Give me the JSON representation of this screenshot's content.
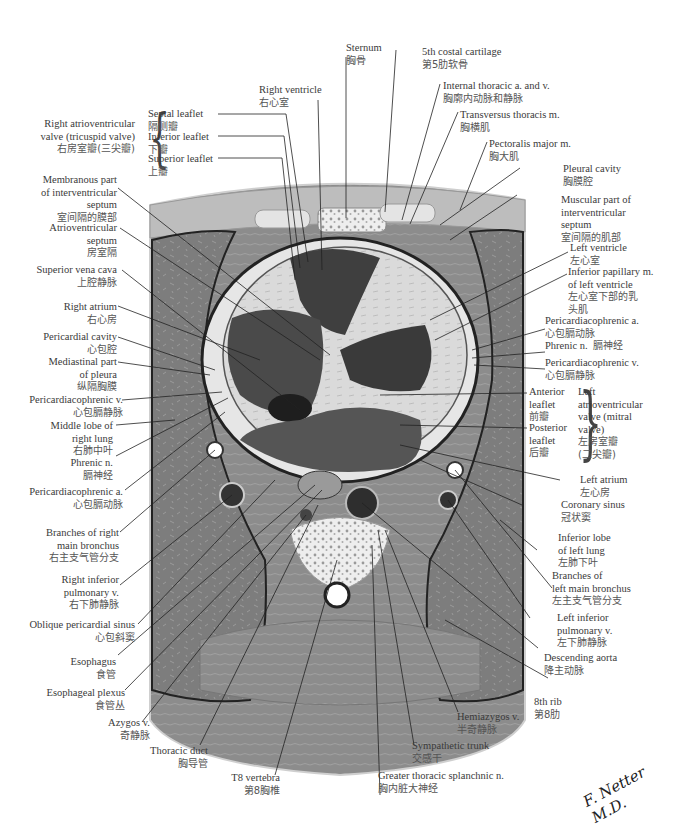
{
  "figure": {
    "type": "anatomical cross-section",
    "palette": {
      "background": "#ffffff",
      "muscle": "#8a8a8a",
      "lung": "#7b7b7b",
      "heart_wall": "#d8d8d8",
      "chamber_dark": "#3c3c3c",
      "bone": "#efefef",
      "line": "#222222",
      "text": "#3a3a3a"
    },
    "signature": "F. Netter M.D."
  },
  "labels": {
    "sternum": {
      "en": "Sternum",
      "zh": "胸骨"
    },
    "costal_cartilage": {
      "en": "5th costal cartilage",
      "zh": "第5肋软骨"
    },
    "internal_thoracic": {
      "en": "Internal thoracic a. and v.",
      "zh": "胸廓内动脉和静脉"
    },
    "transversus_thoracis": {
      "en": "Transversus thoracis m.",
      "zh": "胸横肌"
    },
    "pectoralis_major": {
      "en": "Pectoralis major m.",
      "zh": "胸大肌"
    },
    "right_ventricle": {
      "en": "Right ventricle",
      "zh": "右心室"
    },
    "tricuspid": {
      "group_en": [
        "Right atrioventricular",
        "valve (tricuspid valve)"
      ],
      "group_zh": "右房室瓣(三尖瓣)",
      "leaflets": [
        {
          "en": "Septal leaflet",
          "zh": "隔侧瓣"
        },
        {
          "en": "Inferior leaflet",
          "zh": "下瓣"
        },
        {
          "en": "Superior leaflet",
          "zh": "上瓣"
        }
      ]
    },
    "membranous_septum": {
      "en": [
        "Membranous part",
        "of interventricular",
        "septum"
      ],
      "zh": "室间隔的膜部"
    },
    "av_septum": {
      "en": [
        "Atrioventricular",
        "septum"
      ],
      "zh": "房室隔"
    },
    "svc": {
      "en": "Superior vena cava",
      "zh": "上腔静脉"
    },
    "right_atrium": {
      "en": "Right atrium",
      "zh": "右心房"
    },
    "pericardial_cavity": {
      "en": "Pericardial cavity",
      "zh": "心包腔"
    },
    "mediastinal_pleura": {
      "en": [
        "Mediastinal part",
        "of pleura"
      ],
      "zh": "纵隔胸膜"
    },
    "pericardiacophrenic_v_right": {
      "en": "Pericardiacophrenic v.",
      "zh": "心包膈静脉"
    },
    "middle_lobe": {
      "en": [
        "Middle lobe of",
        "right lung"
      ],
      "zh": "右肺中叶"
    },
    "phrenic_right": {
      "en": "Phrenic n.",
      "zh": "膈神经"
    },
    "pericardiacophrenic_a_right": {
      "en": "Pericardiacophrenic a.",
      "zh": "心包膈动脉"
    },
    "right_bronchus": {
      "en": [
        "Branches of right",
        "main bronchus"
      ],
      "zh": "右主支气管分支"
    },
    "right_inf_pulm_v": {
      "en": [
        "Right inferior",
        "pulmonary v."
      ],
      "zh": "右下肺静脉"
    },
    "oblique_sinus": {
      "en": "Oblique pericardial sinus",
      "zh": "心包斜窦"
    },
    "esophagus": {
      "en": "Esophagus",
      "zh": "食管"
    },
    "esophageal_plexus": {
      "en": "Esophageal plexus",
      "zh": "食管丛"
    },
    "azygos": {
      "en": "Azygos v.",
      "zh": "奇静脉"
    },
    "thoracic_duct": {
      "en": "Thoracic duct",
      "zh": "胸导管"
    },
    "t8": {
      "en": "T8 vertebra",
      "zh": "第8胸椎"
    },
    "greater_splanchnic": {
      "en": "Greater thoracic splanchnic n.",
      "zh": "胸内脏大神经"
    },
    "sympathetic_trunk": {
      "en": "Sympathetic trunk",
      "zh": "交感干"
    },
    "hemiazygos": {
      "en": "Hemiazygos v.",
      "zh": "半奇静脉"
    },
    "rib8": {
      "en": "8th rib",
      "zh": "第8肋"
    },
    "descending_aorta": {
      "en": "Descending aorta",
      "zh": "降主动脉"
    },
    "left_inf_pulm_v": {
      "en": [
        "Left inferior",
        "pulmonary v."
      ],
      "zh": "左下肺静脉"
    },
    "left_bronchus": {
      "en": [
        "Branches of",
        "left main bronchus"
      ],
      "zh": "左主支气管分支"
    },
    "inferior_lobe_left": {
      "en": [
        "Inferior lobe",
        "of left lung"
      ],
      "zh": "左肺下叶"
    },
    "coronary_sinus": {
      "en": "Coronary sinus",
      "zh": "冠状窦"
    },
    "left_atrium": {
      "en": "Left atrium",
      "zh": "左心房"
    },
    "mitral": {
      "group_en": [
        "Left",
        "atrioventricular",
        "valve (mitral",
        "valve)"
      ],
      "group_zh": [
        "左房室瓣",
        "(二尖瓣)"
      ],
      "leaflets": [
        {
          "en": [
            "Anterior",
            "leaflet"
          ],
          "zh": "前瓣"
        },
        {
          "en": [
            "Posterior",
            "leaflet"
          ],
          "zh": "后瓣"
        }
      ]
    },
    "pericardiacophrenic_v_left": {
      "en": "Pericardiacophrenic v.",
      "zh": "心包膈静脉"
    },
    "phrenic_left": {
      "en": "Phrenic n.",
      "zh": "膈神经"
    },
    "pericardiacophrenic_a_left": {
      "en": "Pericardiacophrenic a.",
      "zh": "心包膈动脉"
    },
    "inferior_papillary": {
      "en": [
        "Inferior papillary m.",
        "of left ventricle"
      ],
      "zh": [
        "左心室下部的乳",
        "头肌"
      ]
    },
    "left_ventricle": {
      "en": "Left ventricle",
      "zh": "左心室"
    },
    "muscular_septum": {
      "en": [
        "Muscular part of",
        "interventricular",
        "septum"
      ],
      "zh": "室间隔的肌部"
    },
    "pleural_cavity": {
      "en": "Pleural cavity",
      "zh": "胸膜腔"
    }
  }
}
